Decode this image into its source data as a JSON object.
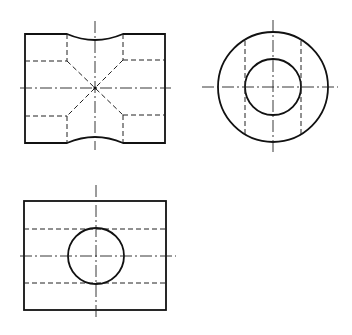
{
  "drawing": {
    "type": "orthographic projection",
    "colors": {
      "background": "#ffffff",
      "line": "#111111"
    },
    "views": [
      {
        "name": "front-view",
        "description": "Rectangular block with concave top and bottom saddle, hidden edges and diagonal hidden lines meeting at center"
      },
      {
        "name": "side-view",
        "description": "Concentric circles (outer and inner bore) with hidden vertical lines"
      },
      {
        "name": "top-view",
        "description": "Rectangle with circular hole and two hidden horizontal lines"
      }
    ]
  }
}
